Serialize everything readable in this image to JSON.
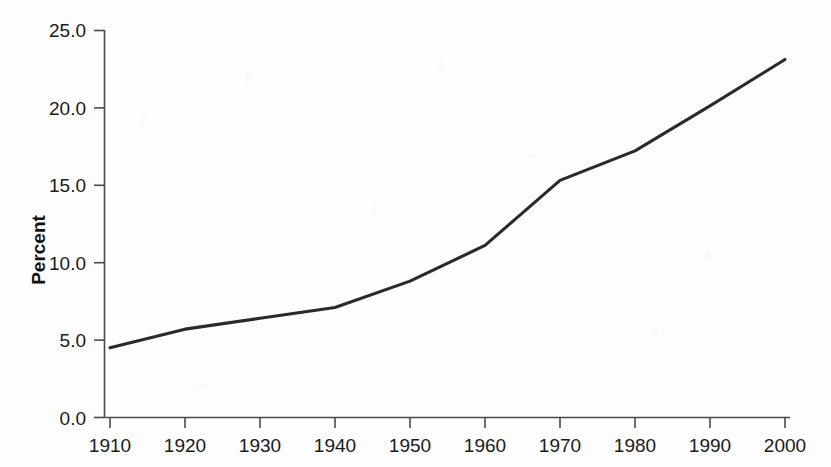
{
  "chart_data": {
    "type": "line",
    "title": "",
    "xlabel": "",
    "ylabel": "Percent",
    "x": [
      1910,
      1920,
      1930,
      1940,
      1950,
      1960,
      1970,
      1980,
      1990,
      2000
    ],
    "values": [
      4.5,
      5.7,
      6.4,
      7.1,
      8.8,
      11.1,
      15.3,
      17.2,
      20.1,
      23.1
    ],
    "series": [
      {
        "name": "Percent",
        "values": [
          4.5,
          5.7,
          6.4,
          7.1,
          8.8,
          11.1,
          15.3,
          17.2,
          20.1,
          23.1
        ],
        "color": "#2a2a2a"
      }
    ],
    "xlim": [
      1910,
      2000
    ],
    "ylim": [
      0.0,
      25.0
    ],
    "xticks": [
      1910,
      1920,
      1930,
      1940,
      1950,
      1960,
      1970,
      1980,
      1990,
      2000
    ],
    "yticks": [
      0.0,
      5.0,
      10.0,
      15.0,
      20.0,
      25.0
    ],
    "xtick_labels": [
      "1910",
      "1920",
      "1930",
      "1940",
      "1950",
      "1960",
      "1970",
      "1980",
      "1990",
      "2000"
    ],
    "ytick_labels": [
      "0.0",
      "5.0",
      "10.0",
      "15.0",
      "20.0",
      "25.0"
    ],
    "grid": false,
    "legend": false,
    "legend_position": "none",
    "line_color": "#2a2a2a",
    "axis_color": "#4a4a4a",
    "background_color": "#fdfdfd"
  }
}
